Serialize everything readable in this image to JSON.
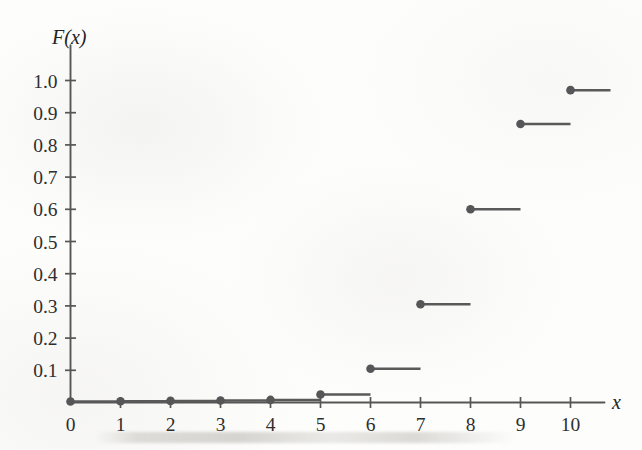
{
  "figure": {
    "name": "cumulative-distribution-step-plot",
    "y_axis_title": "F(x)",
    "x_axis_title": "x"
  },
  "chart_data": {
    "type": "line",
    "subtype": "step-cdf",
    "title": "",
    "xlabel": "x",
    "ylabel": "F(x)",
    "xlim": [
      0,
      11
    ],
    "ylim": [
      0,
      1.05
    ],
    "grid": false,
    "legend": null,
    "x_ticks": [
      0,
      1,
      2,
      3,
      4,
      5,
      6,
      7,
      8,
      9,
      10
    ],
    "x_tick_labels": [
      "0",
      "1",
      "2",
      "3",
      "4",
      "5",
      "6",
      "7",
      "8",
      "9",
      "10"
    ],
    "y_ticks": [
      0.1,
      0.2,
      0.3,
      0.4,
      0.5,
      0.6,
      0.7,
      0.8,
      0.9,
      1.0
    ],
    "y_tick_labels": [
      "0.1",
      "0.2",
      "0.3",
      "0.4",
      "0.5",
      "0.6",
      "0.7",
      "0.8",
      "0.9",
      "1.0"
    ],
    "marker": "filled-circle-left-endpoint",
    "line_color": "#575759",
    "axis_color": "#565654",
    "x": [
      0,
      1,
      2,
      3,
      4,
      5,
      6,
      7,
      8,
      9,
      10
    ],
    "values": [
      0.003,
      0.004,
      0.005,
      0.006,
      0.008,
      0.025,
      0.105,
      0.305,
      0.6,
      0.865,
      0.97
    ],
    "steps": [
      {
        "x_start": 0,
        "x_end": 1,
        "y": 0.003,
        "label": "0"
      },
      {
        "x_start": 1,
        "x_end": 2,
        "y": 0.004,
        "label": "1"
      },
      {
        "x_start": 2,
        "x_end": 3,
        "y": 0.005,
        "label": "2"
      },
      {
        "x_start": 3,
        "x_end": 4,
        "y": 0.006,
        "label": "3"
      },
      {
        "x_start": 4,
        "x_end": 5,
        "y": 0.008,
        "label": "4"
      },
      {
        "x_start": 5,
        "x_end": 6,
        "y": 0.025,
        "label": "5"
      },
      {
        "x_start": 6,
        "x_end": 7,
        "y": 0.105,
        "label": "6"
      },
      {
        "x_start": 7,
        "x_end": 8,
        "y": 0.305,
        "label": "7"
      },
      {
        "x_start": 8,
        "x_end": 9,
        "y": 0.6,
        "label": "8"
      },
      {
        "x_start": 9,
        "x_end": 10,
        "y": 0.865,
        "label": "9"
      },
      {
        "x_start": 10,
        "x_end": 10.8,
        "y": 0.97,
        "label": "10"
      }
    ]
  }
}
